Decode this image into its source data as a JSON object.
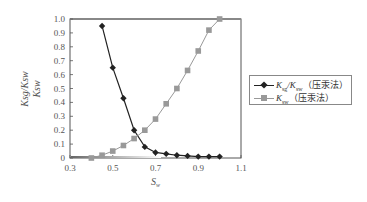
{
  "chart_data": {
    "type": "line",
    "title": "",
    "xlabel": "S_w",
    "ylabel": "K_sg/K_sw, K_sw",
    "xlim": [
      0.3,
      1.1
    ],
    "ylim": [
      0,
      1.0
    ],
    "x_ticks": [
      "0.3",
      "0.5",
      "0.7",
      "0.9",
      "1.1"
    ],
    "y_ticks": [
      "0",
      "0.1",
      "0.2",
      "0.3",
      "0.4",
      "0.5",
      "0.6",
      "0.7",
      "0.8",
      "0.9",
      "1.0"
    ],
    "grid": false,
    "legend_position": "right, outside",
    "series": [
      {
        "name": "K_sg/K_sw（压汞法）",
        "marker": "diamond",
        "color": "#222222",
        "x": [
          0.45,
          0.5,
          0.55,
          0.6,
          0.65,
          0.7,
          0.75,
          0.8,
          0.85,
          0.9,
          0.95,
          1.0
        ],
        "y": [
          0.95,
          0.65,
          0.43,
          0.2,
          0.08,
          0.04,
          0.03,
          0.02,
          0.015,
          0.01,
          0.01,
          0.01
        ]
      },
      {
        "name": "K_sw（压汞法）",
        "marker": "square",
        "color": "#999999",
        "x": [
          0.4,
          0.45,
          0.5,
          0.55,
          0.6,
          0.65,
          0.7,
          0.75,
          0.8,
          0.85,
          0.9,
          0.95,
          1.0
        ],
        "y": [
          0.0,
          0.02,
          0.05,
          0.09,
          0.14,
          0.2,
          0.28,
          0.39,
          0.5,
          0.63,
          0.77,
          0.92,
          1.0
        ]
      }
    ]
  },
  "legend": {
    "items": [
      {
        "main": "K",
        "sub": "sg",
        "sep": "/K",
        "sub2": "sw",
        "suffix": "（压汞法）"
      },
      {
        "main": "K",
        "sub": "sw",
        "suffix": "（压汞法）"
      }
    ]
  },
  "axes": {
    "xlabel_main": "S",
    "xlabel_sub": "w",
    "ylabel_line1": "K_sg/K_sw",
    "ylabel_line2": "K_sw"
  }
}
